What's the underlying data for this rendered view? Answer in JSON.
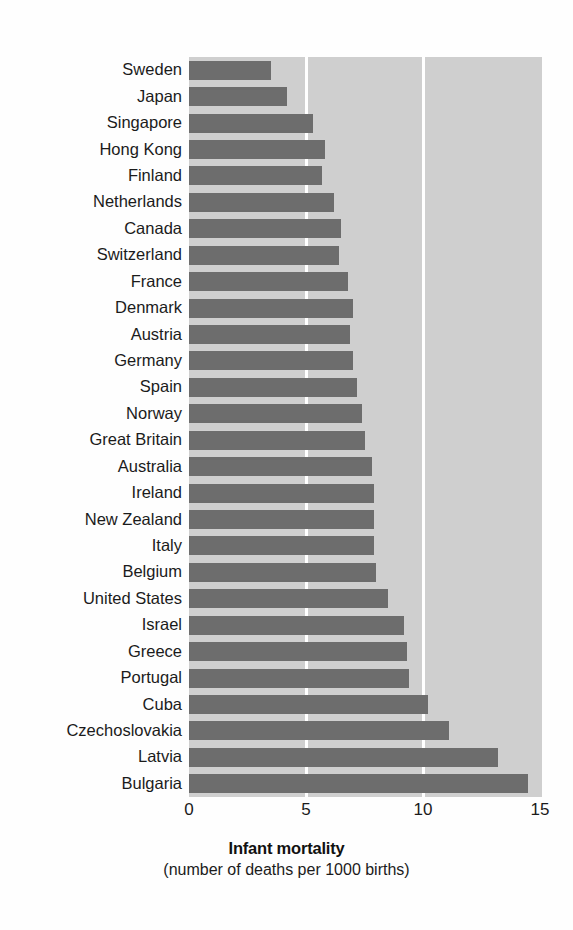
{
  "chart_data": {
    "type": "bar",
    "orientation": "horizontal",
    "title": "Infant mortality",
    "subtitle": "(number of deaths per 1000 births)",
    "xlabel": "Infant mortality",
    "ylabel": "",
    "xlim": [
      0,
      15
    ],
    "xticks": [
      0,
      5,
      10,
      15
    ],
    "xtick_labels": [
      "0",
      "5",
      "10",
      "15"
    ],
    "grid": "vertical-white-gridlines-at-5-and-10",
    "legend": "none",
    "categories": [
      "Sweden",
      "Japan",
      "Singapore",
      "Hong Kong",
      "Finland",
      "Netherlands",
      "Canada",
      "Switzerland",
      "France",
      "Denmark",
      "Austria",
      "Germany",
      "Spain",
      "Norway",
      "Great Britain",
      "Australia",
      "Ireland",
      "New Zealand",
      "Italy",
      "Belgium",
      "United States",
      "Israel",
      "Greece",
      "Portugal",
      "Cuba",
      "Czechoslovakia",
      "Latvia",
      "Bulgaria"
    ],
    "values": [
      3.5,
      4.2,
      5.3,
      5.8,
      5.7,
      6.2,
      6.5,
      6.4,
      6.8,
      7.0,
      6.9,
      7.0,
      7.2,
      7.4,
      7.5,
      7.8,
      7.9,
      7.9,
      7.9,
      8.0,
      8.5,
      9.2,
      9.3,
      9.4,
      10.2,
      11.1,
      13.2,
      14.5
    ],
    "colors": {
      "bar": "#6d6d6d",
      "plot_background": "#cfcfcf",
      "gridline": "#ffffff",
      "page_background": "#fefefe",
      "text": "#1b1b1b"
    }
  }
}
